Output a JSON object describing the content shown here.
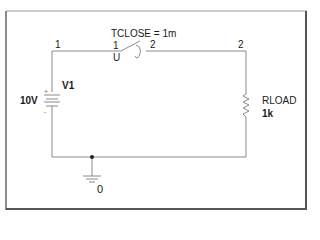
{
  "diagram": {
    "type": "circuit-schematic",
    "colors": {
      "wire": "#8a8a8a",
      "frame": "#555555",
      "text": "#1a1a1a",
      "junction": "#222222"
    },
    "components": {
      "source": {
        "name": "V1",
        "value": "10V",
        "plus": "+",
        "minus": "-"
      },
      "switch": {
        "param": "TCLOSE = 1m",
        "pin_left": "1",
        "pin_right": "2",
        "type_label": "U"
      },
      "resistor": {
        "name": "RLOAD",
        "value": "1k"
      },
      "ground": {
        "node": "0"
      }
    },
    "nodes": {
      "node_top_left": "1",
      "node_top_right": "2"
    }
  }
}
